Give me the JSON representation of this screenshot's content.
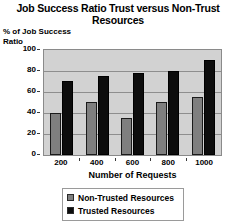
{
  "chart_data": {
    "type": "bar",
    "title": "Job Success Ratio Trust versus Non-Trust Resources",
    "xlabel": "Number of Requests",
    "ylabel": "% of Job Success Ratio",
    "categories": [
      "200",
      "400",
      "600",
      "800",
      "1000"
    ],
    "series": [
      {
        "name": "Non-Trusted Resources",
        "color": "#7f7f7f",
        "values": [
          40,
          50,
          35,
          50,
          55
        ]
      },
      {
        "name": "Trusted Resources",
        "color": "#0d0d0d",
        "values": [
          70,
          75,
          78,
          80,
          90
        ]
      }
    ],
    "ylim": [
      0,
      100
    ],
    "yticks": [
      100,
      80,
      60,
      40,
      20,
      0
    ],
    "grid": true,
    "legend_position": "bottom"
  },
  "ylabel_line1": "% of Job Success",
  "ylabel_line2": "Ratio"
}
